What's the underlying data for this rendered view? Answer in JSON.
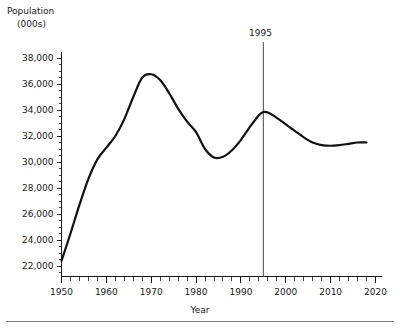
{
  "labels": {
    "ylabel_line1": "Population",
    "ylabel_line2": "(000s)",
    "xlabel": "Year",
    "marker_label": "1995"
  },
  "colors": {
    "curve": "#111111",
    "axis": "#1a1a1a",
    "marker": "#5a5a5a",
    "background": "#ffffff",
    "footer_rule": "#808080"
  },
  "chart_data": {
    "type": "line",
    "title": "",
    "subtitle": "",
    "xlabel": "Year",
    "ylabel": "Population (000s)",
    "xlim": [
      1950,
      2020
    ],
    "ylim": [
      21500,
      38600
    ],
    "grid": false,
    "legend": false,
    "x_ticks": [
      1950,
      1960,
      1970,
      1980,
      1990,
      2000,
      2010,
      2020
    ],
    "x_tick_labels": [
      "1950",
      "1960",
      "1970",
      "1980",
      "1990",
      "2000",
      "2010",
      "2020"
    ],
    "x_minor_tick_interval": 2,
    "y_ticks": [
      22000,
      24000,
      26000,
      28000,
      30000,
      32000,
      34000,
      36000,
      38000
    ],
    "y_tick_labels": [
      "22,000",
      "24,000",
      "26,000",
      "28,000",
      "30,000",
      "32,000",
      "34,000",
      "36,000",
      "38,000"
    ],
    "y_minor_tick_interval": 500,
    "annotations": [
      {
        "type": "vertical-line",
        "x": 1995,
        "label": "1995"
      }
    ],
    "series": [
      {
        "name": "Population",
        "x": [
          1950,
          1952,
          1954,
          1956,
          1958,
          1960,
          1962,
          1964,
          1966,
          1968,
          1970,
          1972,
          1974,
          1976,
          1978,
          1980,
          1982,
          1984,
          1986,
          1988,
          1990,
          1992,
          1994,
          1995,
          1996,
          1998,
          2000,
          2002,
          2004,
          2006,
          2008,
          2010,
          2012,
          2014,
          2016,
          2018
        ],
        "y": [
          22400,
          24500,
          26700,
          28700,
          30200,
          31100,
          32000,
          33300,
          35000,
          36500,
          36750,
          36300,
          35300,
          34100,
          33100,
          32300,
          31000,
          30350,
          30400,
          30900,
          31700,
          32700,
          33600,
          33850,
          33800,
          33400,
          32900,
          32400,
          31900,
          31500,
          31300,
          31250,
          31300,
          31400,
          31500,
          31500
        ]
      }
    ]
  }
}
